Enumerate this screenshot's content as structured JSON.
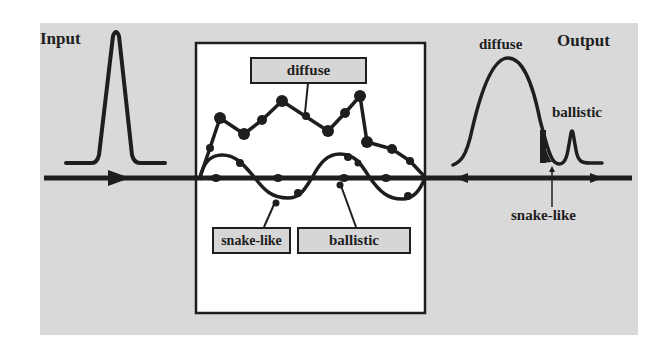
{
  "figure": {
    "background_color": "#d9d9d9",
    "panel_color": "#ffffff",
    "ink_color": "#1e1e1e",
    "input_label": "Input",
    "output_label": "Output",
    "medium_box": {
      "labels": {
        "diffuse": "diffuse",
        "snake_like": "snake-like",
        "ballistic": "ballistic"
      }
    },
    "output_annotations": {
      "diffuse": "diffuse",
      "ballistic": "ballistic",
      "snake_like": "snake-like"
    },
    "components": [
      {
        "name": "diffuse",
        "description": "multiply-scattered photons, zig-zag path, broad late output pulse"
      },
      {
        "name": "snake-like",
        "description": "weakly scattered photons, sinusoidal path near axis, shaded early tail of output"
      },
      {
        "name": "ballistic",
        "description": "unscattered photons, straight path along axis, narrow output spike"
      }
    ]
  }
}
